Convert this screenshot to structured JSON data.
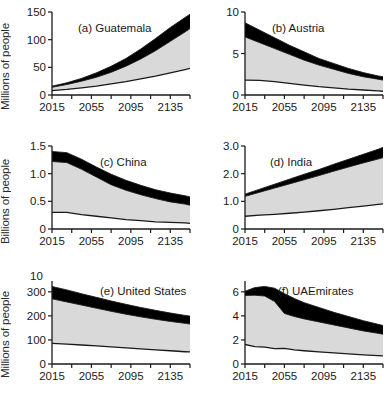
{
  "figure": {
    "rows": 3,
    "cols": 2,
    "xlabel": "",
    "row_ylabels": [
      "Millions of people",
      "Billions of people",
      "Millions of people"
    ],
    "stray_label_panel_e": "10",
    "band_colors": {
      "low": "#ffffff",
      "mid": "#d9d9d9",
      "high": "#000000",
      "axis": "#1a1a1a"
    }
  },
  "chart_data": [
    {
      "type": "area",
      "id": "a",
      "title": "(a) Guatemala",
      "ylabel": "Millions of people",
      "xlabel": "",
      "ylim": [
        0,
        150
      ],
      "xlim": [
        2015,
        2155
      ],
      "yticks": [
        0,
        50,
        100,
        150
      ],
      "ytick_labels": [
        "0",
        "50",
        "100",
        "150"
      ],
      "xticks": [
        2015,
        2055,
        2095,
        2135
      ],
      "xtick_labels": [
        "2015",
        "2055",
        "2095",
        "2135"
      ],
      "minor_xticks": [
        2015,
        2035,
        2055,
        2075,
        2095,
        2115,
        2135,
        2155
      ],
      "grid": false,
      "legend": "none",
      "x": [
        2015,
        2030,
        2045,
        2060,
        2075,
        2090,
        2105,
        2120,
        2135,
        2150,
        2155
      ],
      "series": [
        {
          "name": "low",
          "values": [
            8,
            10,
            13,
            16,
            20,
            24,
            29,
            34,
            40,
            46,
            48
          ]
        },
        {
          "name": "medium",
          "values": [
            14,
            19,
            25,
            32,
            41,
            52,
            65,
            80,
            97,
            114,
            120
          ]
        },
        {
          "name": "high",
          "values": [
            16,
            22,
            30,
            40,
            52,
            66,
            83,
            102,
            122,
            140,
            146
          ]
        }
      ]
    },
    {
      "type": "area",
      "id": "b",
      "title": "(b) Austria",
      "ylabel": "Millions of people",
      "xlabel": "",
      "ylim": [
        0,
        10
      ],
      "xlim": [
        2015,
        2155
      ],
      "yticks": [
        0,
        5,
        10
      ],
      "ytick_labels": [
        "0",
        "5",
        "10"
      ],
      "xticks": [
        2015,
        2055,
        2095,
        2135
      ],
      "xtick_labels": [
        "2015",
        "2055",
        "2095",
        "2135"
      ],
      "minor_xticks": [
        2015,
        2035,
        2055,
        2075,
        2095,
        2115,
        2135,
        2155
      ],
      "grid": false,
      "legend": "none",
      "x": [
        2015,
        2030,
        2045,
        2060,
        2075,
        2090,
        2105,
        2120,
        2135,
        2150,
        2155
      ],
      "series": [
        {
          "name": "low",
          "values": [
            1.8,
            1.75,
            1.6,
            1.4,
            1.2,
            1.0,
            0.85,
            0.7,
            0.6,
            0.5,
            0.45
          ]
        },
        {
          "name": "medium",
          "values": [
            7.0,
            6.3,
            5.6,
            4.9,
            4.2,
            3.6,
            3.1,
            2.6,
            2.2,
            1.9,
            1.8
          ]
        },
        {
          "name": "high",
          "values": [
            8.7,
            7.8,
            6.9,
            6.0,
            5.2,
            4.4,
            3.8,
            3.2,
            2.7,
            2.3,
            2.2
          ]
        }
      ]
    },
    {
      "type": "area",
      "id": "c",
      "title": "(c) China",
      "ylabel": "Billions of people",
      "xlabel": "",
      "ylim": [
        0,
        1.5
      ],
      "xlim": [
        2015,
        2155
      ],
      "yticks": [
        0,
        0.5,
        1.0,
        1.5
      ],
      "ytick_labels": [
        "0",
        "0.5",
        "1.0",
        "1.5"
      ],
      "xticks": [
        2015,
        2055,
        2095,
        2135
      ],
      "xtick_labels": [
        "2015",
        "2055",
        "2095",
        "2135"
      ],
      "minor_xticks": [
        2015,
        2035,
        2055,
        2075,
        2095,
        2115,
        2135,
        2155
      ],
      "grid": false,
      "legend": "none",
      "x": [
        2015,
        2030,
        2045,
        2060,
        2075,
        2090,
        2105,
        2120,
        2135,
        2150,
        2155
      ],
      "series": [
        {
          "name": "low",
          "values": [
            0.3,
            0.3,
            0.26,
            0.23,
            0.2,
            0.17,
            0.15,
            0.13,
            0.12,
            0.11,
            0.1
          ]
        },
        {
          "name": "medium",
          "values": [
            1.22,
            1.2,
            1.08,
            0.94,
            0.8,
            0.7,
            0.62,
            0.55,
            0.49,
            0.45,
            0.43
          ]
        },
        {
          "name": "high",
          "values": [
            1.4,
            1.38,
            1.26,
            1.12,
            0.99,
            0.88,
            0.79,
            0.71,
            0.65,
            0.6,
            0.58
          ]
        }
      ]
    },
    {
      "type": "area",
      "id": "d",
      "title": "(d) India",
      "ylabel": "Billions of people",
      "xlabel": "",
      "ylim": [
        0,
        3.0
      ],
      "xlim": [
        2015,
        2155
      ],
      "yticks": [
        0,
        1.0,
        2.0,
        3.0
      ],
      "ytick_labels": [
        "0",
        "1.0",
        "2.0",
        "3.0"
      ],
      "xticks": [
        2015,
        2055,
        2095,
        2135
      ],
      "xtick_labels": [
        "2015",
        "2055",
        "2095",
        "2135"
      ],
      "minor_xticks": [
        2015,
        2035,
        2055,
        2075,
        2095,
        2115,
        2135,
        2155
      ],
      "grid": false,
      "legend": "none",
      "x": [
        2015,
        2030,
        2045,
        2060,
        2075,
        2090,
        2105,
        2120,
        2135,
        2150,
        2155
      ],
      "series": [
        {
          "name": "low",
          "values": [
            0.46,
            0.5,
            0.53,
            0.57,
            0.61,
            0.66,
            0.71,
            0.77,
            0.83,
            0.89,
            0.91
          ]
        },
        {
          "name": "medium",
          "values": [
            1.18,
            1.33,
            1.48,
            1.63,
            1.78,
            1.93,
            2.09,
            2.24,
            2.39,
            2.53,
            2.58
          ]
        },
        {
          "name": "high",
          "values": [
            1.26,
            1.44,
            1.62,
            1.8,
            1.98,
            2.15,
            2.34,
            2.52,
            2.7,
            2.88,
            2.95
          ]
        }
      ]
    },
    {
      "type": "area",
      "id": "e",
      "title": "(e) United States",
      "ylabel": "Millions of people",
      "xlabel": "",
      "ylim": [
        0,
        345
      ],
      "xlim": [
        2015,
        2155
      ],
      "yticks": [
        0,
        100,
        200,
        300
      ],
      "ytick_labels": [
        "0",
        "100",
        "200",
        "300"
      ],
      "xticks": [
        2015,
        2055,
        2095,
        2135
      ],
      "xtick_labels": [
        "2015",
        "2055",
        "2095",
        "2135"
      ],
      "minor_xticks": [
        2015,
        2035,
        2055,
        2075,
        2095,
        2115,
        2135,
        2155
      ],
      "grid": false,
      "legend": "none",
      "x": [
        2015,
        2030,
        2045,
        2060,
        2075,
        2090,
        2105,
        2120,
        2135,
        2150,
        2155
      ],
      "series": [
        {
          "name": "low",
          "values": [
            86,
            83,
            79,
            75,
            71,
            67,
            63,
            59,
            55,
            51,
            50
          ]
        },
        {
          "name": "medium",
          "values": [
            271,
            258,
            245,
            232,
            219,
            207,
            196,
            186,
            177,
            169,
            166
          ]
        },
        {
          "name": "high",
          "values": [
            322,
            308,
            292,
            277,
            262,
            248,
            235,
            223,
            212,
            202,
            199
          ]
        }
      ]
    },
    {
      "type": "area",
      "id": "f",
      "title": "(f) UAEmirates",
      "ylabel": "Millions of people",
      "xlabel": "",
      "ylim": [
        0,
        6.9
      ],
      "xlim": [
        2015,
        2155
      ],
      "yticks": [
        0,
        2,
        4,
        6
      ],
      "ytick_labels": [
        "0",
        "2",
        "4",
        "6"
      ],
      "xticks": [
        2015,
        2055,
        2095,
        2135
      ],
      "xtick_labels": [
        "2015",
        "2055",
        "2095",
        "2135"
      ],
      "minor_xticks": [
        2015,
        2035,
        2055,
        2075,
        2095,
        2115,
        2135,
        2155
      ],
      "grid": false,
      "legend": "none",
      "x": [
        2015,
        2025,
        2035,
        2045,
        2055,
        2065,
        2075,
        2090,
        2105,
        2120,
        2135,
        2150,
        2155
      ],
      "series": [
        {
          "name": "low",
          "values": [
            1.62,
            1.45,
            1.4,
            1.28,
            1.3,
            1.18,
            1.1,
            1.0,
            0.92,
            0.84,
            0.76,
            0.7,
            0.68
          ]
        },
        {
          "name": "medium",
          "values": [
            5.7,
            5.72,
            5.65,
            5.2,
            4.2,
            3.95,
            3.75,
            3.5,
            3.25,
            3.0,
            2.75,
            2.55,
            2.48
          ]
        },
        {
          "name": "high",
          "values": [
            6.05,
            6.35,
            6.45,
            6.3,
            5.85,
            5.45,
            5.1,
            4.7,
            4.3,
            3.95,
            3.6,
            3.3,
            3.2
          ]
        }
      ]
    }
  ]
}
